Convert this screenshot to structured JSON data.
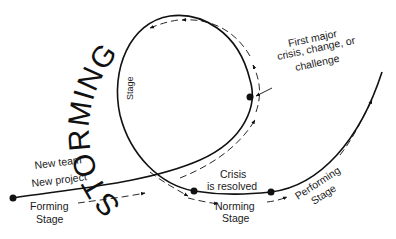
{
  "diagram": {
    "title_word": "STORMING",
    "colors": {
      "line": "#111111",
      "background": "#ffffff",
      "text": "#1a1a1a"
    },
    "labels": {
      "storming_stage": "Stage",
      "new_team": "New team",
      "new_project": "New project",
      "forming_line1": "Forming",
      "forming_line2": "Stage",
      "crisis_line1": "First major",
      "crisis_line2": "crisis, change, or",
      "crisis_line3": "challenge",
      "resolved_line1": "Crisis",
      "resolved_line2": "is resolved",
      "norming_line1": "Norming",
      "norming_line2": "Stage",
      "performing_line1": "Performing",
      "performing_line2": "Stage"
    },
    "nodes": [
      {
        "name": "forming-start",
        "x": 13,
        "y": 198
      },
      {
        "name": "first-crisis",
        "x": 250,
        "y": 97
      },
      {
        "name": "crisis-resolved",
        "x": 194,
        "y": 191
      },
      {
        "name": "norming-end",
        "x": 271,
        "y": 192
      }
    ]
  }
}
